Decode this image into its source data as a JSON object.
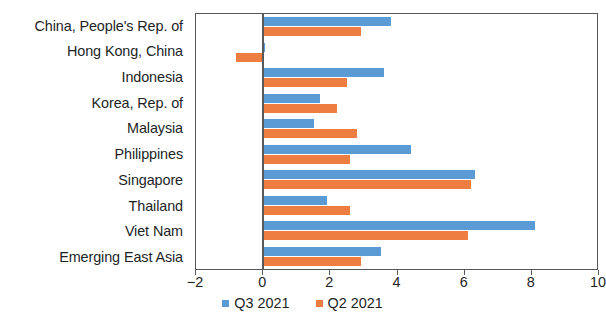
{
  "chart_data": {
    "type": "bar",
    "orientation": "horizontal",
    "title": "",
    "subtitle": "",
    "xlabel": "",
    "ylabel": "",
    "xlim": [
      -2,
      10
    ],
    "xticks": [
      "-2",
      "0",
      "2",
      "4",
      "6",
      "8",
      "10"
    ],
    "xtick_values": [
      -2,
      0,
      2,
      4,
      6,
      8,
      10
    ],
    "grid": false,
    "legend_position": "bottom-center",
    "categories": [
      "China, People's Rep. of",
      "Hong Kong, China",
      "Indonesia",
      "Korea, Rep. of",
      "Malaysia",
      "Philippines",
      "Singapore",
      "Thailand",
      "Viet Nam",
      "Emerging East Asia"
    ],
    "series": [
      {
        "name": "Q3 2021",
        "color": "#5B9BD5",
        "values": [
          3.8,
          0.05,
          3.6,
          1.7,
          1.5,
          4.4,
          6.3,
          1.9,
          8.1,
          3.5
        ]
      },
      {
        "name": "Q2 2021",
        "color": "#ED7D41",
        "values": [
          2.9,
          -0.8,
          2.5,
          2.2,
          2.8,
          2.6,
          6.2,
          2.6,
          6.1,
          2.9
        ]
      }
    ]
  },
  "legend": {
    "items": [
      {
        "label": "Q3 2021",
        "color": "#5B9BD5"
      },
      {
        "label": "Q2 2021",
        "color": "#ED7D41"
      }
    ]
  }
}
